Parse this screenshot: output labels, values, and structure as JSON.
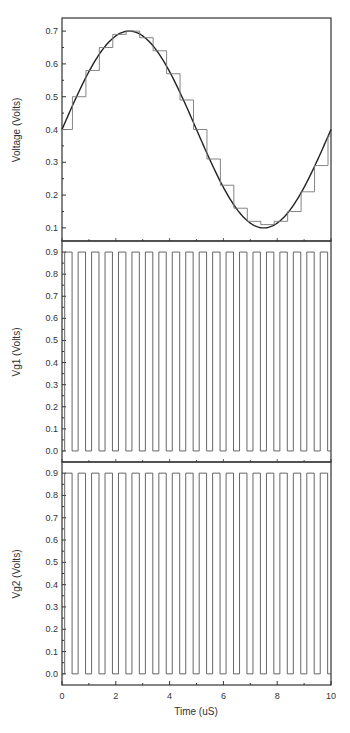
{
  "chart_data": [
    {
      "type": "line",
      "panel": "top",
      "title": "",
      "xlabel": "",
      "ylabel": "Voltage (Volts)",
      "xlim": [
        0,
        10
      ],
      "ylim": [
        0.06,
        0.74
      ],
      "yticks": [
        "0.1",
        "0.2",
        "0.3",
        "0.4",
        "0.5",
        "0.6",
        "0.7"
      ],
      "grid": false,
      "series": [
        {
          "name": "sine reference",
          "style": "smooth",
          "x": [
            0,
            0.5,
            1,
            1.5,
            2,
            2.5,
            3,
            3.5,
            4,
            4.5,
            5,
            5.5,
            6,
            6.5,
            7,
            7.5,
            8,
            8.5,
            9,
            9.5,
            10
          ],
          "y": [
            0.4,
            0.49,
            0.58,
            0.64,
            0.69,
            0.7,
            0.69,
            0.64,
            0.58,
            0.49,
            0.4,
            0.31,
            0.22,
            0.16,
            0.11,
            0.1,
            0.11,
            0.16,
            0.22,
            0.31,
            0.4
          ]
        },
        {
          "name": "sampled staircase",
          "style": "step",
          "x": [
            0,
            0.5,
            1,
            1.5,
            2,
            2.5,
            3,
            3.5,
            4,
            4.5,
            5,
            5.5,
            6,
            6.5,
            7,
            7.5,
            8,
            8.5,
            9,
            9.5,
            10
          ],
          "y": [
            0.4,
            0.5,
            0.58,
            0.65,
            0.69,
            0.7,
            0.68,
            0.64,
            0.57,
            0.49,
            0.4,
            0.31,
            0.23,
            0.16,
            0.12,
            0.11,
            0.12,
            0.15,
            0.21,
            0.29,
            0.38
          ]
        }
      ]
    },
    {
      "type": "line",
      "panel": "middle",
      "title": "",
      "xlabel": "",
      "ylabel": "Vg1 (Volts)",
      "xlim": [
        0,
        10
      ],
      "ylim": [
        -0.05,
        0.95
      ],
      "yticks": [
        "0.0",
        "0.1",
        "0.2",
        "0.3",
        "0.4",
        "0.5",
        "0.6",
        "0.7",
        "0.8",
        "0.9"
      ],
      "grid": false,
      "series": [
        {
          "name": "Vg1 pulse train",
          "style": "square",
          "period": 0.5,
          "high": 0.9,
          "low": 0.0,
          "pulse_count": 20,
          "duty": 0.55
        }
      ]
    },
    {
      "type": "line",
      "panel": "bottom",
      "title": "",
      "xlabel": "Time (uS)",
      "ylabel": "Vg2 (Volts)",
      "xlim": [
        0,
        10
      ],
      "ylim": [
        -0.05,
        0.95
      ],
      "xticks": [
        "0",
        "2",
        "4",
        "6",
        "8",
        "10"
      ],
      "yticks": [
        "0.0",
        "0.1",
        "0.2",
        "0.3",
        "0.4",
        "0.5",
        "0.6",
        "0.7",
        "0.8",
        "0.9"
      ],
      "grid": false,
      "series": [
        {
          "name": "Vg2 pulse train",
          "style": "square",
          "period": 0.5,
          "high": 0.9,
          "low": 0.0,
          "pulse_count": 20,
          "duty": 0.55
        }
      ]
    }
  ],
  "labels": {
    "top_ylabel": "Voltage (Volts)",
    "mid_ylabel": "Vg1 (Volts)",
    "bot_ylabel": "Vg2 (Volts)",
    "xlabel": "Time (uS)"
  },
  "colors": {
    "frame": "#333333",
    "trace": "#555555",
    "text": "#333333"
  }
}
